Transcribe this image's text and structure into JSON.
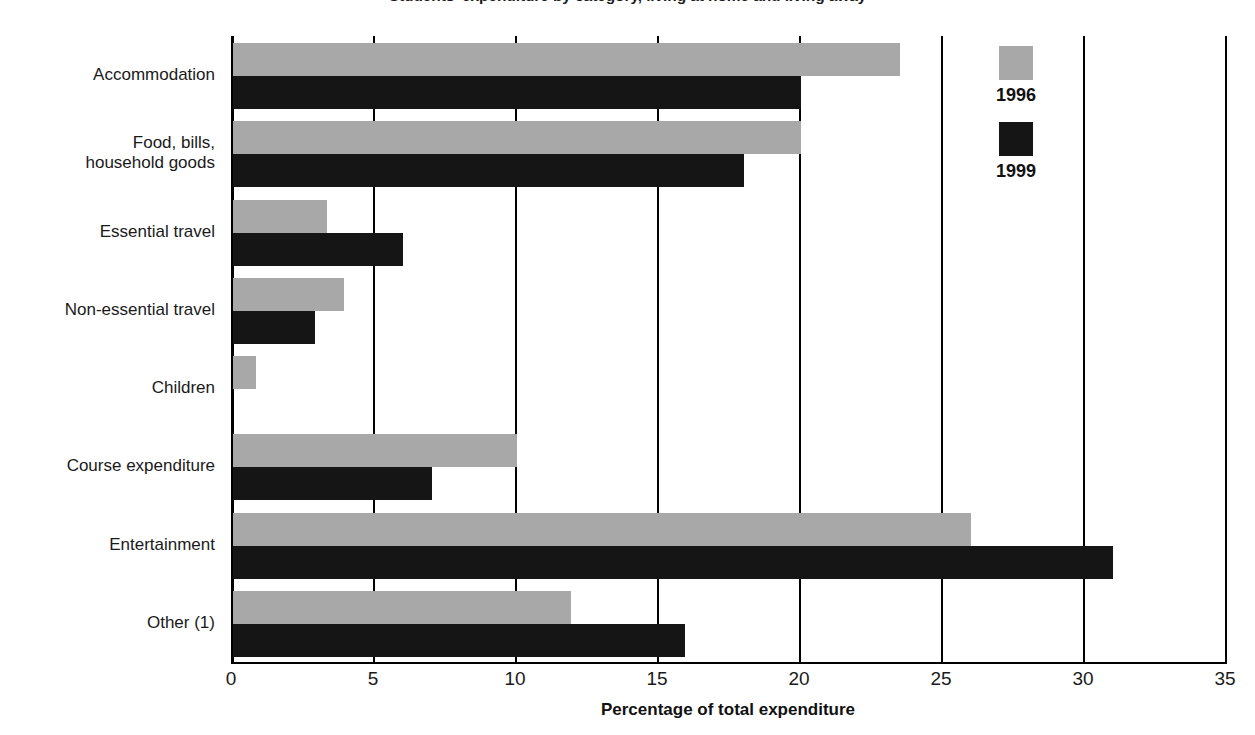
{
  "chart_data": {
    "type": "bar",
    "orientation": "horizontal",
    "title": "Students' expenditure by category, living at home and living away",
    "xlabel": "Percentage of total expenditure",
    "ylabel": "",
    "xlim": [
      0,
      35
    ],
    "xticks": [
      "0",
      "5",
      "10",
      "15",
      "20",
      "25",
      "30",
      "35"
    ],
    "grid": true,
    "legend_position": "top-right",
    "categories": [
      "Accommodation",
      "Food, bills,\nhousehold goods",
      "Essential travel",
      "Non-essential travel",
      "Children",
      "Course expenditure",
      "Entertainment",
      "Other (1)"
    ],
    "series": [
      {
        "name": "1996",
        "color": "#a8a8a8",
        "values": [
          23.5,
          20.0,
          3.3,
          3.9,
          0.8,
          10.0,
          26.0,
          11.9
        ]
      },
      {
        "name": "1999",
        "color": "#151515",
        "values": [
          20.0,
          18.0,
          6.0,
          2.9,
          0.0,
          7.0,
          31.0,
          15.9
        ]
      }
    ]
  },
  "categories_display": [
    {
      "line1": "Accommodation",
      "line2": ""
    },
    {
      "line1": "Food, bills,",
      "line2": "household goods"
    },
    {
      "line1": "Essential travel",
      "line2": ""
    },
    {
      "line1": "Non-essential travel",
      "line2": ""
    },
    {
      "line1": "Children",
      "line2": ""
    },
    {
      "line1": "Course expenditure",
      "line2": ""
    },
    {
      "line1": "Entertainment",
      "line2": ""
    },
    {
      "line1": "Other (1)",
      "line2": ""
    }
  ],
  "legend": {
    "items": [
      {
        "label": "1996",
        "color": "#a8a8a8"
      },
      {
        "label": "1999",
        "color": "#151515"
      }
    ]
  },
  "axis": {
    "x_title": "Percentage of total expenditure",
    "ticks": [
      "0",
      "5",
      "10",
      "15",
      "20",
      "25",
      "30",
      "35"
    ]
  }
}
